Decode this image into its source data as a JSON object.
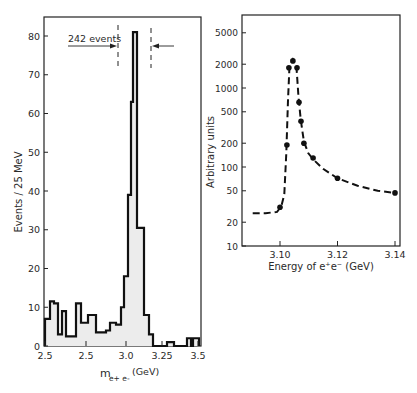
{
  "chart_data": [
    {
      "type": "bar",
      "subtype": "histogram",
      "title": "",
      "xlabel": "m e+e- (GeV)",
      "xlabel_main": "m",
      "xlabel_sub": "e+e-",
      "xlabel_unit": "(GeV)",
      "ylabel": "Events / 25 MeV",
      "ylim": [
        0,
        85
      ],
      "yticks": [
        0,
        10,
        20,
        30,
        40,
        50,
        60,
        70,
        80
      ],
      "xtick_labels": [
        "2.5",
        "2.5",
        "3.0",
        "3.25",
        "3.5"
      ],
      "xtick_px": [
        45,
        86,
        126,
        162,
        198
      ],
      "grid": false,
      "fill_color": "#ececec",
      "annotation": {
        "text": "242 events",
        "left_dashed_line_px": 118,
        "right_dashed_line_px": 150
      },
      "bins": [
        {
          "x0": 45,
          "x1": 50,
          "value": 7
        },
        {
          "x0": 50,
          "x1": 54,
          "value": 11.5
        },
        {
          "x0": 54,
          "x1": 58,
          "value": 11
        },
        {
          "x0": 58,
          "x1": 62,
          "value": 3
        },
        {
          "x0": 62,
          "x1": 66,
          "value": 9
        },
        {
          "x0": 66,
          "x1": 76,
          "value": 2.5
        },
        {
          "x0": 76,
          "x1": 81,
          "value": 11
        },
        {
          "x0": 81,
          "x1": 88,
          "value": 6
        },
        {
          "x0": 88,
          "x1": 96,
          "value": 8
        },
        {
          "x0": 96,
          "x1": 106,
          "value": 3.5
        },
        {
          "x0": 106,
          "x1": 110,
          "value": 4
        },
        {
          "x0": 110,
          "x1": 116,
          "value": 6
        },
        {
          "x0": 116,
          "x1": 121,
          "value": 5.5
        },
        {
          "x0": 121,
          "x1": 124,
          "value": 10
        },
        {
          "x0": 124,
          "x1": 128,
          "value": 18
        },
        {
          "x0": 128,
          "x1": 131,
          "value": 39
        },
        {
          "x0": 131,
          "x1": 133,
          "value": 63
        },
        {
          "x0": 133,
          "x1": 137,
          "value": 81
        },
        {
          "x0": 137,
          "x1": 144,
          "value": 30.5
        },
        {
          "x0": 144,
          "x1": 149,
          "value": 8
        },
        {
          "x0": 149,
          "x1": 153,
          "value": 3
        },
        {
          "x0": 153,
          "x1": 167,
          "value": 0
        },
        {
          "x0": 167,
          "x1": 174,
          "value": 1
        },
        {
          "x0": 174,
          "x1": 187,
          "value": 0
        },
        {
          "x0": 187,
          "x1": 191,
          "value": 2
        },
        {
          "x0": 191,
          "x1": 193,
          "value": 0
        },
        {
          "x0": 193,
          "x1": 199,
          "value": 2
        }
      ]
    },
    {
      "type": "line",
      "subtype": "scatter-with-dashed-fit",
      "title": "",
      "xlabel": "Energy of e+e- (GeV)",
      "ylabel": "Arbitrary units",
      "yscale": "log",
      "ylim": [
        10,
        8000
      ],
      "xlim": [
        3.087,
        3.142
      ],
      "yticks": [
        10,
        20,
        50,
        100,
        200,
        500,
        1000,
        2000,
        5000
      ],
      "xticks": [
        3.1,
        3.12,
        3.14
      ],
      "xtick_labels": [
        "3.10",
        "3.12",
        "3.14"
      ],
      "grid": false,
      "series": [
        {
          "name": "data",
          "x": [
            3.1,
            3.1024,
            3.1031,
            3.1045,
            3.1059,
            3.1066,
            3.1073,
            3.1083,
            3.1115,
            3.12,
            3.14
          ],
          "y": [
            31,
            190,
            1800,
            2200,
            1800,
            660,
            380,
            200,
            130,
            72,
            47
          ]
        },
        {
          "name": "fit (dashed)",
          "x": [
            3.0905,
            3.095,
            3.099,
            3.1005,
            3.1015,
            3.1022,
            3.1028,
            3.1033,
            3.1045,
            3.1057,
            3.1064,
            3.1072,
            3.1083,
            3.1098,
            3.1115,
            3.115,
            3.12,
            3.127,
            3.134,
            3.14
          ],
          "y": [
            26,
            26,
            27,
            32,
            45,
            150,
            700,
            1900,
            2300,
            1900,
            800,
            400,
            210,
            150,
            125,
            95,
            72,
            58,
            50,
            47
          ]
        }
      ]
    }
  ],
  "left_chart": {
    "ylabel": "Events / 25 MeV",
    "yticks": [
      "0",
      "10",
      "20",
      "30",
      "40",
      "50",
      "60",
      "70",
      "80"
    ],
    "xticks": [
      "2.5",
      "2.5",
      "3.0",
      "3.25",
      "3.5"
    ],
    "xlabel_main": "m",
    "xlabel_sub": "e+ e-",
    "xlabel_unit": "(GeV)",
    "annotation": "242 events"
  },
  "right_chart": {
    "ylabel": "Arbitrary units",
    "yticks": [
      "10",
      "20",
      "50",
      "100",
      "200",
      "500",
      "1000",
      "2000",
      "5000"
    ],
    "xticks": [
      "3.10",
      "3.12",
      "3.14"
    ],
    "xlabel": "Energy of e⁺e⁻ (GeV)"
  }
}
